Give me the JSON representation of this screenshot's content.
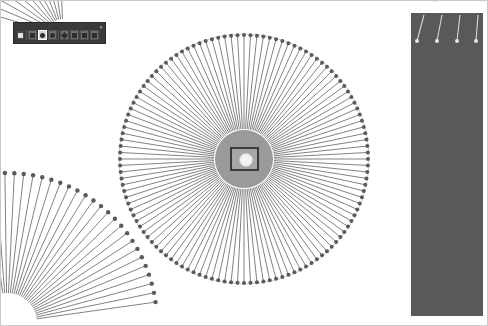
{
  "canvas": {
    "width": 488,
    "height": 326,
    "background": "#ffffff",
    "border_color": "#c9c9c9",
    "title": "Action trajectory overlay"
  },
  "colors": {
    "stroke": "#6b6b6b",
    "stroke_light": "#d8d8d8",
    "endpoint": "#5a5a5a",
    "endpoint_light": "#e6e6e6",
    "disc": "#9a9a9a",
    "panel": "#595959",
    "toolbar_bg": "#3a3a3a",
    "toolbar_button": "#6e6e6e",
    "toolbar_button_active": "#d6d6d6",
    "selection_border": "#3c3c3c",
    "ring": "#d0d0d0"
  },
  "toolbar": {
    "name": "floating-toolbar",
    "x": 12,
    "y": 21,
    "width": 93,
    "height": 22,
    "close_glyph": "×",
    "buttons": [
      {
        "id": "pointer",
        "label": "Pointer",
        "icon": "cursor-icon",
        "shape": "arrow",
        "state": "flat"
      },
      {
        "id": "select",
        "label": "Select",
        "icon": "select-icon",
        "shape": "square",
        "state": "normal"
      },
      {
        "id": "move",
        "label": "Move",
        "icon": "move-icon",
        "shape": "round",
        "state": "active"
      },
      {
        "id": "dot",
        "label": "Point",
        "icon": "point-icon",
        "shape": "round",
        "state": "normal"
      },
      {
        "id": "rotate",
        "label": "Rotate",
        "icon": "rotate-icon",
        "shape": "diamond",
        "state": "normal"
      },
      {
        "id": "scale",
        "label": "Scale",
        "icon": "scale-icon",
        "shape": "square",
        "state": "normal"
      },
      {
        "id": "crop",
        "label": "Crop",
        "icon": "crop-icon",
        "shape": "square",
        "state": "normal"
      },
      {
        "id": "more",
        "label": "More",
        "icon": "more-icon",
        "shape": "square",
        "state": "normal"
      }
    ]
  },
  "right_panel": {
    "name": "right-gray-panel",
    "x": 410,
    "y": 12,
    "width": 72,
    "height": 303,
    "fill": "#595959"
  },
  "center_target": {
    "name": "center-target",
    "cx": 243,
    "cy": 158,
    "disc_radius": 29,
    "box": {
      "x": 229,
      "y": 146,
      "width": 29,
      "height": 24
    },
    "cursor": {
      "cx": 243,
      "cy": 157,
      "r": 7,
      "icon": "move-cursor-icon"
    },
    "ring_radius": 125
  },
  "chart_data": {
    "type": "scatter",
    "xlabel": "",
    "ylabel": "",
    "xlim": [
      0,
      488
    ],
    "ylim": [
      0,
      326
    ],
    "grid": false,
    "legend": "none",
    "annotations": [
      "Central radial burst of 120 trajectories around cursor at (243,158)",
      "Top-left fan of 12 trajectories from toolbar origin (60,36)",
      "Bottom-left fan of 26 trajectories from corner origin (6,320)",
      "Top-right fan of 7 trajectories converging toward (452,6)",
      "Four white trajectories drawn on the right gray panel"
    ],
    "series": [
      {
        "name": "center-burst",
        "origin": [
          243,
          158
        ],
        "count": 120,
        "angle_start_deg": 0,
        "angle_end_deg": 360,
        "radius_inner": 30,
        "radius_outer": 124,
        "stroke": "#6b6b6b",
        "endpoint": "#5a5a5a",
        "endpoint_radius": 2.0
      },
      {
        "name": "toolbar-fan",
        "origin": [
          62,
          34
        ],
        "count": 12,
        "angle_start_deg": 196,
        "angle_end_deg": 268,
        "radius_inner": 16,
        "radius_outer": 96,
        "stroke": "#6b6b6b",
        "endpoint": "#5a5a5a",
        "endpoint_radius": 2.0
      },
      {
        "name": "bottom-left-fan",
        "origin": [
          6,
          322
        ],
        "count": 26,
        "angle_start_deg": 262,
        "angle_end_deg": 352,
        "radius_inner": 30,
        "radius_outer": 150,
        "stroke": "#6b6b6b",
        "endpoint": "#5a5a5a",
        "endpoint_radius": 2.2
      },
      {
        "name": "top-right-fan",
        "origin": [
          455,
          2
        ],
        "count": 7,
        "angle_start_deg": 186,
        "angle_end_deg": 226,
        "radius_inner": 20,
        "radius_outer": 125,
        "stroke": "#6b6b6b",
        "endpoint": "#5a5a5a",
        "endpoint_radius": 2.0
      },
      {
        "name": "panel-strokes",
        "stroke": "#d8d8d8",
        "endpoint": "#e6e6e6",
        "endpoint_radius": 2.0,
        "lines": [
          {
            "x1": 423,
            "y1": 14,
            "x2": 416,
            "y2": 40
          },
          {
            "x1": 441,
            "y1": 14,
            "x2": 436,
            "y2": 40
          },
          {
            "x1": 459,
            "y1": 14,
            "x2": 456,
            "y2": 40
          },
          {
            "x1": 477,
            "y1": 14,
            "x2": 475,
            "y2": 40
          }
        ]
      }
    ]
  }
}
